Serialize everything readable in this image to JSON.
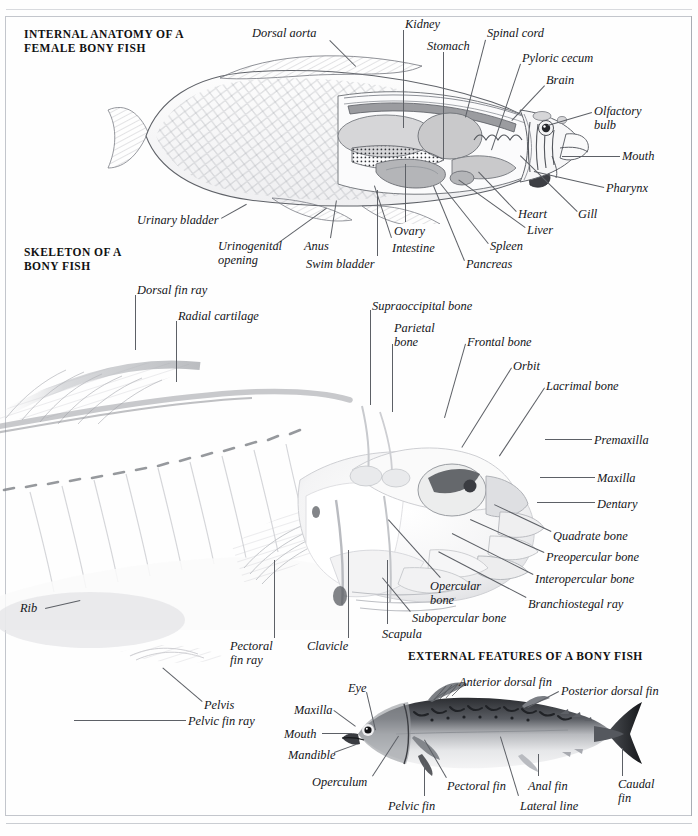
{
  "page": {
    "background": "#ffffff",
    "ink_color": "#15161a",
    "frame_color": "#b9bcc2"
  },
  "sections": [
    {
      "id": "internal-anatomy",
      "heading": "INTERNAL ANATOMY OF A\nFEMALE BONY FISH",
      "heading_pos": {
        "x": 24,
        "y": 28
      }
    },
    {
      "id": "skeleton",
      "heading": "SKELETON OF A\nBONY FISH",
      "heading_pos": {
        "x": 24,
        "y": 246
      }
    },
    {
      "id": "external-features",
      "heading": "EXTERNAL FEATURES OF A BONY FISH",
      "heading_pos": {
        "x": 408,
        "y": 650
      }
    }
  ],
  "internal_anatomy_labels": [
    {
      "text": "Dorsal aorta",
      "x": 252,
      "y": 27,
      "align": "left",
      "lead": {
        "x1": 330,
        "y1": 40,
        "x2": 356,
        "y2": 66
      }
    },
    {
      "text": "Kidney",
      "x": 405,
      "y": 18,
      "align": "left",
      "lead": {
        "x1": 404,
        "y1": 30,
        "x2": 404,
        "y2": 128
      }
    },
    {
      "text": "Stomach",
      "x": 427,
      "y": 40,
      "align": "left",
      "lead": {
        "x1": 444,
        "y1": 52,
        "x2": 444,
        "y2": 160
      }
    },
    {
      "text": "Spinal cord",
      "x": 487,
      "y": 27,
      "align": "left",
      "lead": {
        "x1": 486,
        "y1": 40,
        "x2": 466,
        "y2": 117
      }
    },
    {
      "text": "Pyloric cecum",
      "x": 522,
      "y": 52,
      "align": "left",
      "lead": {
        "x1": 521,
        "y1": 64,
        "x2": 492,
        "y2": 150
      }
    },
    {
      "text": "Brain",
      "x": 546,
      "y": 74,
      "align": "left",
      "lead": {
        "x1": 545,
        "y1": 86,
        "x2": 512,
        "y2": 121
      }
    },
    {
      "text": "Olfactory\nbulb",
      "x": 594,
      "y": 105,
      "align": "left",
      "lead": {
        "x1": 592,
        "y1": 113,
        "x2": 548,
        "y2": 126
      }
    },
    {
      "text": "Mouth",
      "x": 622,
      "y": 150,
      "align": "left",
      "lead": {
        "x1": 620,
        "y1": 157,
        "x2": 562,
        "y2": 157
      }
    },
    {
      "text": "Pharynx",
      "x": 606,
      "y": 182,
      "align": "left",
      "lead": {
        "x1": 604,
        "y1": 188,
        "x2": 534,
        "y2": 172
      }
    },
    {
      "text": "Gill",
      "x": 578,
      "y": 208,
      "align": "left",
      "lead": {
        "x1": 577,
        "y1": 212,
        "x2": 520,
        "y2": 156
      }
    },
    {
      "text": "Heart",
      "x": 518,
      "y": 208,
      "align": "left",
      "lead": {
        "x1": 516,
        "y1": 212,
        "x2": 478,
        "y2": 172
      }
    },
    {
      "text": "Liver",
      "x": 527,
      "y": 224,
      "align": "left",
      "lead": {
        "x1": 525,
        "y1": 228,
        "x2": 458,
        "y2": 180
      }
    },
    {
      "text": "Spleen",
      "x": 490,
      "y": 240,
      "align": "left",
      "lead": {
        "x1": 488,
        "y1": 244,
        "x2": 440,
        "y2": 184
      }
    },
    {
      "text": "Pancreas",
      "x": 466,
      "y": 258,
      "align": "left",
      "lead": {
        "x1": 464,
        "y1": 261,
        "x2": 433,
        "y2": 186
      }
    },
    {
      "text": "Ovary",
      "x": 394,
      "y": 225,
      "align": "left",
      "lead": {
        "x1": 405,
        "y1": 222,
        "x2": 405,
        "y2": 164
      }
    },
    {
      "text": "Intestine",
      "x": 392,
      "y": 242,
      "align": "left",
      "lead": {
        "x1": 391,
        "y1": 238,
        "x2": 374,
        "y2": 186
      }
    },
    {
      "text": "Swim bladder",
      "x": 306,
      "y": 258,
      "align": "left",
      "lead": {
        "x1": 377,
        "y1": 256,
        "x2": 377,
        "y2": 190
      }
    },
    {
      "text": "Anus",
      "x": 304,
      "y": 240,
      "align": "left",
      "lead": {
        "x1": 330,
        "y1": 238,
        "x2": 336,
        "y2": 200
      }
    },
    {
      "text": "Urinogenital\nopening",
      "x": 218,
      "y": 240,
      "align": "left",
      "lead": {
        "x1": 276,
        "y1": 244,
        "x2": 326,
        "y2": 208
      }
    },
    {
      "text": "Urinary bladder",
      "x": 137,
      "y": 214,
      "align": "left",
      "lead": {
        "x1": 221,
        "y1": 218,
        "x2": 246,
        "y2": 204
      }
    }
  ],
  "skeleton_labels": [
    {
      "text": "Dorsal fin ray",
      "x": 137,
      "y": 284,
      "align": "left",
      "lead": {
        "x1": 136,
        "y1": 295,
        "x2": 136,
        "y2": 350
      }
    },
    {
      "text": "Radial cartilage",
      "x": 178,
      "y": 310,
      "align": "left",
      "lead": {
        "x1": 177,
        "y1": 321,
        "x2": 177,
        "y2": 382
      }
    },
    {
      "text": "Supraoccipital bone",
      "x": 372,
      "y": 300,
      "align": "left",
      "lead": {
        "x1": 371,
        "y1": 310,
        "x2": 371,
        "y2": 405
      }
    },
    {
      "text": "Parietal\nbone",
      "x": 394,
      "y": 322,
      "align": "left",
      "lead": {
        "x1": 393,
        "y1": 344,
        "x2": 393,
        "y2": 412
      }
    },
    {
      "text": "Frontal bone",
      "x": 467,
      "y": 336,
      "align": "left",
      "lead": {
        "x1": 466,
        "y1": 344,
        "x2": 445,
        "y2": 418
      }
    },
    {
      "text": "Orbit",
      "x": 513,
      "y": 360,
      "align": "left",
      "lead": {
        "x1": 512,
        "y1": 368,
        "x2": 462,
        "y2": 448
      }
    },
    {
      "text": "Lacrimal bone",
      "x": 546,
      "y": 380,
      "align": "left",
      "lead": {
        "x1": 545,
        "y1": 388,
        "x2": 500,
        "y2": 456
      }
    },
    {
      "text": "Premaxilla",
      "x": 594,
      "y": 434,
      "align": "left",
      "lead": {
        "x1": 592,
        "y1": 440,
        "x2": 545,
        "y2": 440
      }
    },
    {
      "text": "Maxilla",
      "x": 597,
      "y": 472,
      "align": "left",
      "lead": {
        "x1": 595,
        "y1": 478,
        "x2": 540,
        "y2": 478
      }
    },
    {
      "text": "Dentary",
      "x": 597,
      "y": 498,
      "align": "left",
      "lead": {
        "x1": 595,
        "y1": 503,
        "x2": 537,
        "y2": 503
      }
    },
    {
      "text": "Quadrate bone",
      "x": 553,
      "y": 530,
      "align": "left",
      "lead": {
        "x1": 551,
        "y1": 532,
        "x2": 494,
        "y2": 505
      }
    },
    {
      "text": "Preopercular bone",
      "x": 546,
      "y": 551,
      "align": "left",
      "lead": {
        "x1": 544,
        "y1": 553,
        "x2": 470,
        "y2": 520
      }
    },
    {
      "text": "Interopercular bone",
      "x": 535,
      "y": 573,
      "align": "left",
      "lead": {
        "x1": 533,
        "y1": 575,
        "x2": 452,
        "y2": 534
      }
    },
    {
      "text": "Branchiostegal ray",
      "x": 528,
      "y": 598,
      "align": "left",
      "lead": {
        "x1": 526,
        "y1": 598,
        "x2": 438,
        "y2": 552
      }
    },
    {
      "text": "Opercular\nbone",
      "x": 430,
      "y": 580,
      "align": "left",
      "lead": {
        "x1": 440,
        "y1": 578,
        "x2": 388,
        "y2": 520
      }
    },
    {
      "text": "Subopercular bone",
      "x": 412,
      "y": 612,
      "align": "left",
      "lead": {
        "x1": 410,
        "y1": 612,
        "x2": 382,
        "y2": 578
      }
    },
    {
      "text": "Scapula",
      "x": 382,
      "y": 628,
      "align": "left",
      "lead": {
        "x1": 387,
        "y1": 624,
        "x2": 387,
        "y2": 560
      }
    },
    {
      "text": "Clavicle",
      "x": 307,
      "y": 640,
      "align": "left",
      "lead": {
        "x1": 348,
        "y1": 638,
        "x2": 348,
        "y2": 550
      }
    },
    {
      "text": "Pectoral\nfin ray",
      "x": 230,
      "y": 640,
      "align": "left",
      "lead": {
        "x1": 274,
        "y1": 638,
        "x2": 274,
        "y2": 560
      }
    },
    {
      "text": "Rib",
      "x": 20,
      "y": 602,
      "align": "left",
      "lead": {
        "x1": 45,
        "y1": 608,
        "x2": 80,
        "y2": 600
      }
    },
    {
      "text": "Pelvis",
      "x": 204,
      "y": 699,
      "align": "left",
      "lead": {
        "x1": 202,
        "y1": 702,
        "x2": 162,
        "y2": 668
      }
    },
    {
      "text": "Pelvic fin ray",
      "x": 188,
      "y": 715,
      "align": "left",
      "lead": {
        "x1": 186,
        "y1": 721,
        "x2": 74,
        "y2": 721
      }
    }
  ],
  "external_labels": [
    {
      "text": "Eye",
      "x": 348,
      "y": 682,
      "align": "left",
      "lead": {
        "x1": 367,
        "y1": 692,
        "x2": 376,
        "y2": 730
      }
    },
    {
      "text": "Anterior dorsal fin",
      "x": 459,
      "y": 676,
      "align": "left",
      "lead": {
        "x1": 458,
        "y1": 684,
        "x2": 434,
        "y2": 700
      }
    },
    {
      "text": "Posterior dorsal fin",
      "x": 561,
      "y": 685,
      "align": "left",
      "lead": {
        "x1": 559,
        "y1": 692,
        "x2": 528,
        "y2": 708
      }
    },
    {
      "text": "Maxilla",
      "x": 294,
      "y": 704,
      "align": "left",
      "lead": {
        "x1": 334,
        "y1": 710,
        "x2": 356,
        "y2": 726
      }
    },
    {
      "text": "Mouth",
      "x": 284,
      "y": 728,
      "align": "left",
      "lead": {
        "x1": 322,
        "y1": 733,
        "x2": 352,
        "y2": 733
      }
    },
    {
      "text": "Mandible",
      "x": 288,
      "y": 749,
      "align": "left",
      "lead": {
        "x1": 334,
        "y1": 752,
        "x2": 356,
        "y2": 744
      }
    },
    {
      "text": "Operculum",
      "x": 312,
      "y": 776,
      "align": "left",
      "lead": {
        "x1": 372,
        "y1": 776,
        "x2": 398,
        "y2": 736
      }
    },
    {
      "text": "Pelvic fin",
      "x": 388,
      "y": 800,
      "align": "left",
      "lead": {
        "x1": 424,
        "y1": 796,
        "x2": 424,
        "y2": 762
      }
    },
    {
      "text": "Pectoral fin",
      "x": 447,
      "y": 780,
      "align": "left",
      "lead": {
        "x1": 446,
        "y1": 778,
        "x2": 424,
        "y2": 740
      }
    },
    {
      "text": "Anal fin",
      "x": 528,
      "y": 780,
      "align": "left",
      "lead": {
        "x1": 538,
        "y1": 776,
        "x2": 538,
        "y2": 754
      }
    },
    {
      "text": "Lateral line",
      "x": 520,
      "y": 800,
      "align": "left",
      "lead": {
        "x1": 518,
        "y1": 796,
        "x2": 500,
        "y2": 737
      }
    },
    {
      "text": "Caudal\nfin",
      "x": 618,
      "y": 778,
      "align": "left",
      "lead": {
        "x1": 622,
        "y1": 776,
        "x2": 622,
        "y2": 748
      }
    }
  ]
}
